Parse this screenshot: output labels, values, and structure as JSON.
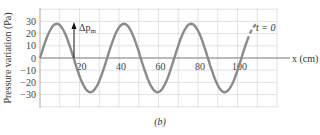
{
  "figure_label": "(b)",
  "chart_data": {
    "type": "line",
    "title": "",
    "xlabel": "x (cm)",
    "ylabel": "Pressure variation (Pa)",
    "xlim": [
      0,
      120
    ],
    "ylim": [
      -40,
      40
    ],
    "x_ticks": [
      20,
      40,
      60,
      80,
      100
    ],
    "y_ticks": [
      30,
      20,
      10,
      0,
      -10,
      -20,
      -30
    ],
    "grid": true,
    "series": [
      {
        "name": "t = 0",
        "function": "28*sin(2*pi*x/34)",
        "amplitude": 28,
        "wavelength_cm": 34,
        "x": [
          0,
          4,
          8.5,
          13,
          17,
          21,
          25.5,
          30,
          34,
          38,
          42.5,
          47,
          51,
          55,
          59.5,
          64,
          68,
          72,
          76.5,
          81,
          85,
          89,
          93.5,
          98,
          102,
          106,
          110
        ],
        "values": [
          0,
          19,
          28,
          19,
          0,
          -19,
          -28,
          -19,
          0,
          19,
          28,
          19,
          0,
          -19,
          -28,
          -19,
          0,
          19,
          28,
          19,
          0,
          -19,
          -28,
          -19,
          0,
          19,
          28
        ],
        "solid_until_x": 105,
        "dashed_from_x": 105
      }
    ],
    "annotations": [
      {
        "text": "Δp_m",
        "type": "arrow",
        "x": 17,
        "from_y": 0,
        "to_y": 28
      },
      {
        "text": "t = 0",
        "x": 113,
        "y": 26
      }
    ]
  },
  "axes": {
    "xlabel": "x (cm)",
    "ylabel": "Pressure variation (Pa)",
    "x_ticks": [
      "20",
      "40",
      "60",
      "80",
      "100"
    ],
    "y_ticks": [
      "30",
      "20",
      "10",
      "0",
      "−10",
      "−20",
      "−30"
    ],
    "amplitude_label": "Δp",
    "amplitude_sub": "m",
    "curve_label": "t = 0"
  }
}
